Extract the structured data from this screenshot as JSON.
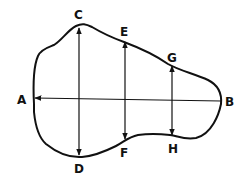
{
  "diagram": {
    "type": "irregular-shape-with-measurement-lines",
    "labels": {
      "A": "A",
      "B": "B",
      "C": "C",
      "D": "D",
      "E": "E",
      "F": "F",
      "G": "G",
      "H": "H"
    },
    "stroke_color": "#111111",
    "background": "#ffffff"
  }
}
